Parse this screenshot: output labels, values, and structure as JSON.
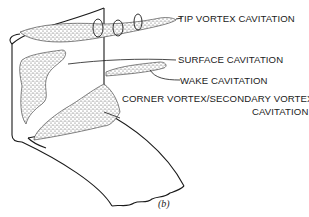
{
  "figure": {
    "caption": "(b)",
    "labels": {
      "tip_vortex": "TIP VORTEX CAVITATION",
      "surface": "SURFACE CAVITATION",
      "wake": "WAKE CAVITATION",
      "corner_line1": "CORNER VORTEX/SECONDARY VORTEX",
      "corner_line2": "CAVITATION"
    },
    "colors": {
      "ink": "#1a1a1a",
      "background": "#ffffff",
      "stipple": "#555555"
    }
  }
}
